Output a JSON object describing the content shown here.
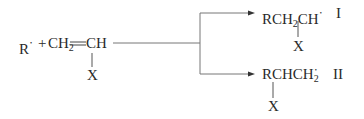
{
  "reactants": {
    "radical": "R",
    "radical_dot": "•",
    "plus": "+",
    "ch2": "CH",
    "ch2_sub": "2",
    "double_bond": "═",
    "ch": "CH",
    "substituent": "X"
  },
  "products": [
    {
      "label": "I",
      "formula_prefix": "RCH",
      "formula_sub": "2",
      "formula_suffix": "CH",
      "radical_dot": "•",
      "substituent": "X",
      "substituent_on": "CH (terminal)"
    },
    {
      "label": "II",
      "formula_prefix": "RCHCH",
      "formula_sub": "2",
      "radical_dot": "•",
      "substituent": "X",
      "substituent_on": "CH (first)"
    }
  ],
  "colors": {
    "ink": "#2a2a2a",
    "line": "#6e6e6e",
    "background": "#ffffff"
  }
}
